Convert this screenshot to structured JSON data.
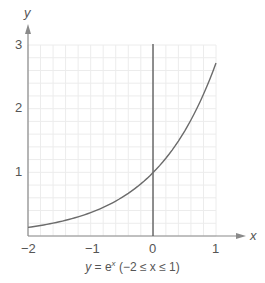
{
  "chart_data": {
    "type": "line",
    "xlabel": "x",
    "ylabel": "y",
    "xlim": [
      -2,
      1
    ],
    "ylim": [
      0,
      3
    ],
    "grid": true,
    "x_ticks": [
      "−2",
      "−1",
      "0",
      "1"
    ],
    "y_ticks": [
      "1",
      "2",
      "3"
    ],
    "series": [
      {
        "name": "y = e^x",
        "x": [
          -2,
          -1.5,
          -1,
          -0.5,
          0,
          0.5,
          1
        ],
        "values": [
          0.135,
          0.223,
          0.368,
          0.607,
          1.0,
          1.649,
          2.718
        ]
      }
    ]
  },
  "labels": {
    "x_axis": "x",
    "y_axis": "y",
    "x_tick_m2": "−2",
    "x_tick_m1": "−1",
    "x_tick_0": "0",
    "x_tick_1": "1",
    "y_tick_1": "1",
    "y_tick_2": "2",
    "y_tick_3": "3",
    "caption_y": "y",
    "caption_eq": " = e",
    "caption_sup": "x",
    "caption_range": " (−2 ≤ x ≤ 1)"
  },
  "colors": {
    "curve": "#6b6b6b",
    "axis": "#8a8a8a",
    "grid": "#ececec"
  }
}
